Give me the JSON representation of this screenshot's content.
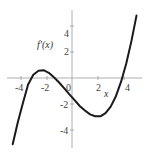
{
  "chart_data": {
    "type": "line",
    "title": "",
    "xlabel": "x",
    "ylabel": "f'(x)",
    "xlim": [
      -5,
      5.2
    ],
    "ylim": [
      -5.2,
      5
    ],
    "grid": false,
    "legend": null,
    "x_ticks": [
      "-4",
      "-2",
      "0",
      "2",
      "4"
    ],
    "y_ticks": [
      "4",
      "2",
      "-2",
      "-4"
    ],
    "series": [
      {
        "name": "f'(x)",
        "x": [
          -4.6,
          -4.2,
          -3.8,
          -3.4,
          -3.0,
          -2.6,
          -2.2,
          -1.8,
          -1.4,
          -1.0,
          -0.6,
          -0.2,
          0.2,
          0.6,
          1.0,
          1.4,
          1.8,
          2.2,
          2.6,
          3.0,
          3.4,
          3.8,
          4.2,
          4.6,
          5.0
        ],
        "values": [
          -5.1,
          -3.4,
          -1.9,
          -0.5,
          0.25,
          0.55,
          0.6,
          0.4,
          0.05,
          -0.35,
          -0.8,
          -1.25,
          -1.7,
          -2.15,
          -2.5,
          -2.8,
          -2.95,
          -2.95,
          -2.7,
          -2.2,
          -1.4,
          -0.3,
          1.1,
          2.8,
          4.8
        ]
      }
    ],
    "annotations": [
      "f'(x)",
      "x"
    ],
    "roots_approx": [
      -3.3,
      -0.4,
      4
    ]
  },
  "labels": {
    "ylabel": "f'(x)",
    "xlabel": "x",
    "xticks": [
      "-4",
      "-2",
      "0",
      "2",
      "4"
    ],
    "yticks": [
      "4",
      "2",
      "-2",
      "-4"
    ]
  }
}
